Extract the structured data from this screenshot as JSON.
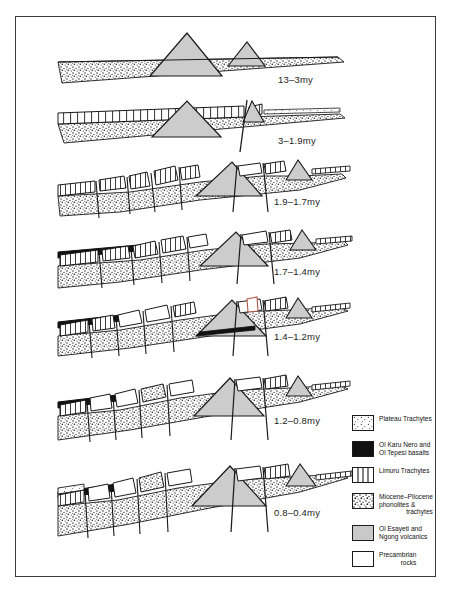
{
  "figure": {
    "frame_color": "#3a3a3c",
    "background": "#ffffff"
  },
  "stages": [
    {
      "id": "stage-1",
      "label": "13–3my",
      "label_x": 286,
      "label_y": 80,
      "panel_top": 24,
      "panel_height": 64
    },
    {
      "id": "stage-2",
      "label": "3–1.9my",
      "label_x": 286,
      "label_y": 141,
      "panel_top": 96,
      "panel_height": 56
    },
    {
      "id": "stage-3",
      "label": "1.9–1.7my",
      "label_x": 282,
      "label_y": 202,
      "panel_top": 158,
      "panel_height": 60
    },
    {
      "id": "stage-4",
      "label": "1.7–1.4my",
      "label_x": 282,
      "label_y": 272,
      "panel_top": 226,
      "panel_height": 62
    },
    {
      "id": "stage-5",
      "label": "1.4–1.2my",
      "label_x": 282,
      "label_y": 337,
      "panel_top": 292,
      "panel_height": 68
    },
    {
      "id": "stage-6",
      "label": "1.2–0.8my",
      "label_x": 282,
      "label_y": 421,
      "panel_top": 372,
      "panel_height": 70
    },
    {
      "id": "stage-7",
      "label": "0.8–0.4my",
      "label_x": 282,
      "label_y": 513,
      "panel_top": 462,
      "panel_height": 90
    }
  ],
  "legend": {
    "items": [
      {
        "key": "plateau-trachytes",
        "pattern": "stipple-light",
        "line1": "Plateau Trachytes",
        "line2": ""
      },
      {
        "key": "ol-karu-nero-basalts",
        "pattern": "solid-black",
        "line1": "Ol Karu Nero and",
        "line2": "Ol Tepesi basalts"
      },
      {
        "key": "limuru-trachytes",
        "pattern": "vertical-lines",
        "line1": "Limuru Trachytes",
        "line2": ""
      },
      {
        "key": "miocene-pliocene",
        "pattern": "stipple-dense",
        "line1": "Miocene–Pliocene",
        "line2": "phonolites &",
        "line3": "trachytes"
      },
      {
        "key": "ol-esayeti-ngong",
        "pattern": "solid-gray",
        "line1": "Ol Esayeti and",
        "line2": "Ngong volcanics"
      },
      {
        "key": "precambrian-rocks",
        "pattern": "white-blank",
        "line1": "Precambrian",
        "line2": "rocks"
      }
    ]
  },
  "colors": {
    "outline": "#1a1a1a",
    "cone_gray": "#c9c9c9",
    "basalt_black": "#111111",
    "stipple_bg": "#ffffff",
    "frame": "#3a3a3c"
  }
}
